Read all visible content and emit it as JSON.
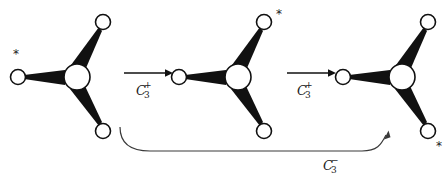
{
  "figure": {
    "title": "",
    "background_color": "#ffffff",
    "ink_color": "#111111",
    "width": 448,
    "height": 180
  },
  "molecules": [
    {
      "id": "molecule-1",
      "center": {
        "x": 77,
        "y": 77,
        "r": 13
      },
      "ligands": [
        {
          "name": "ligand-upper-right",
          "x": 103,
          "y": 22,
          "r": 7.5,
          "starred": false
        },
        {
          "name": "ligand-left",
          "x": 18,
          "y": 77,
          "r": 7.5,
          "starred": true
        },
        {
          "name": "ligand-lower-right",
          "x": 103,
          "y": 131,
          "r": 7.5,
          "starred": false
        }
      ],
      "star_marker": "*",
      "star_position": {
        "x": 13,
        "y": 58
      }
    },
    {
      "id": "molecule-2",
      "center": {
        "x": 238,
        "y": 77,
        "r": 13
      },
      "ligands": [
        {
          "name": "ligand-upper-right",
          "x": 264,
          "y": 22,
          "r": 7.5,
          "starred": true
        },
        {
          "name": "ligand-left",
          "x": 179,
          "y": 77,
          "r": 7.5,
          "starred": false
        },
        {
          "name": "ligand-lower-right",
          "x": 264,
          "y": 131,
          "r": 7.5,
          "starred": false
        }
      ],
      "star_marker": "*",
      "star_position": {
        "x": 277,
        "y": 18
      }
    },
    {
      "id": "molecule-3",
      "center": {
        "x": 402,
        "y": 77,
        "r": 13
      },
      "ligands": [
        {
          "name": "ligand-upper-right",
          "x": 428,
          "y": 22,
          "r": 7.5,
          "starred": false
        },
        {
          "name": "ligand-left",
          "x": 343,
          "y": 77,
          "r": 7.5,
          "starred": false
        },
        {
          "name": "ligand-lower-right",
          "x": 428,
          "y": 131,
          "r": 7.5,
          "starred": true
        }
      ],
      "star_marker": "*",
      "star_position": {
        "x": 437,
        "y": 148
      }
    }
  ],
  "arrows": [
    {
      "id": "arrow-1",
      "kind": "straight",
      "direction": "left-to-right",
      "from_x": 124,
      "to_x": 170,
      "y": 73,
      "label": {
        "symbol": "C",
        "subscript": "3",
        "superscript": "+",
        "x": 136,
        "y": 93
      }
    },
    {
      "id": "arrow-2",
      "kind": "straight",
      "direction": "left-to-right",
      "from_x": 287,
      "to_x": 333,
      "y": 73,
      "label": {
        "symbol": "C",
        "subscript": "3",
        "superscript": "+",
        "x": 297,
        "y": 93
      }
    },
    {
      "id": "arrow-3",
      "kind": "curved",
      "direction": "left-to-right",
      "label": {
        "symbol": "C",
        "subscript": "3",
        "superscript": "−",
        "x": 323,
        "y": 168
      }
    }
  ]
}
